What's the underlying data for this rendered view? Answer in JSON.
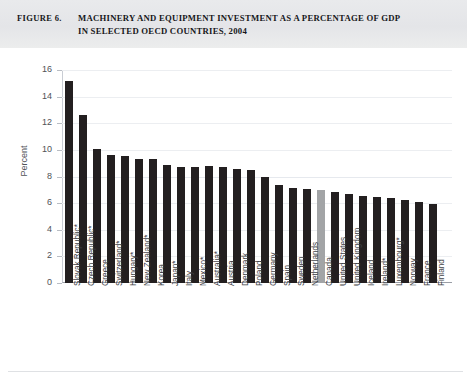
{
  "figure": {
    "label": "FIGURE 6.",
    "title_line1": "MACHINERY AND EQUIPMENT INVESTMENT AS A PERCENTAGE OF GDP",
    "title_line2": "IN SELECTED OECD COUNTRIES, 2004"
  },
  "axis": {
    "y_title": "Percent",
    "y_ticks": [
      "0",
      "2",
      "4",
      "6",
      "8",
      "10",
      "12",
      "14",
      "16"
    ]
  },
  "colors": {
    "bar": "#231f20",
    "highlight_bar": "#a2a4a6",
    "header_band": "#e6e7ea",
    "gridline": "#eceef1",
    "axis": "#9a9ea6",
    "text": "#3e4146"
  },
  "chart_data": {
    "type": "bar",
    "title": "MACHINERY AND EQUIPMENT INVESTMENT AS A PERCENTAGE OF GDP IN SELECTED OECD COUNTRIES, 2004",
    "xlabel": "",
    "ylabel": "Percent",
    "ylim": [
      0,
      16
    ],
    "ytick_step": 2,
    "grid": true,
    "legend": "none",
    "highlighted_category": "Canada",
    "categories": [
      "Slovak Republic*",
      "Czech Republic*",
      "Greece",
      "Switzerland*",
      "Hungary*",
      "New Zealand*",
      "Korea",
      "Japan*",
      "Italy",
      "Mexico*",
      "Australia*",
      "Austria",
      "Denmark",
      "Poland",
      "Germany",
      "Spain",
      "Sweden",
      "Netherlands",
      "Canada",
      "United States",
      "United Kingdom",
      "Iceland",
      "Ireland*",
      "Luxembourg*",
      "Norway",
      "France",
      "Finland"
    ],
    "values": [
      15.2,
      12.6,
      10.05,
      9.65,
      9.55,
      9.35,
      9.3,
      8.85,
      8.75,
      8.75,
      8.8,
      8.7,
      8.6,
      8.5,
      8.0,
      7.4,
      7.1,
      7.05,
      7.0,
      6.85,
      6.65,
      6.5,
      6.45,
      6.4,
      6.2,
      6.05,
      5.95
    ]
  }
}
